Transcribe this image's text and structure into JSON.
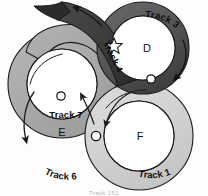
{
  "diagram": {
    "background": "#fdfdfd",
    "outline_color": "#1a1a1a",
    "tracks": [
      {
        "id": "track3",
        "label": "Track 3",
        "fill": "#555555",
        "direction": "clockwise"
      },
      {
        "id": "track4",
        "label": "Track 4",
        "fill": "#3c3c3c",
        "direction": "counter-clockwise"
      },
      {
        "id": "track7",
        "label": "Track 7",
        "fill": "#ffffff",
        "direction": "none"
      },
      {
        "id": "track6",
        "label": "Track 6",
        "fill": "#a8a8a8",
        "direction": "counter-clockwise"
      },
      {
        "id": "track1",
        "label": "Track 1",
        "fill": "#d2d2d2",
        "direction": "clockwise"
      }
    ],
    "nodes": [
      {
        "id": "nodeD",
        "label": "D"
      },
      {
        "id": "nodeE",
        "label": "E"
      },
      {
        "id": "nodeF",
        "label": "F"
      }
    ],
    "markers": [
      {
        "id": "star-junction",
        "shape": "star"
      },
      {
        "id": "junction-top-right",
        "shape": "circle"
      },
      {
        "id": "junction-left",
        "shape": "circle"
      },
      {
        "id": "junction-center",
        "shape": "circle"
      }
    ],
    "caption": "Track 151"
  }
}
